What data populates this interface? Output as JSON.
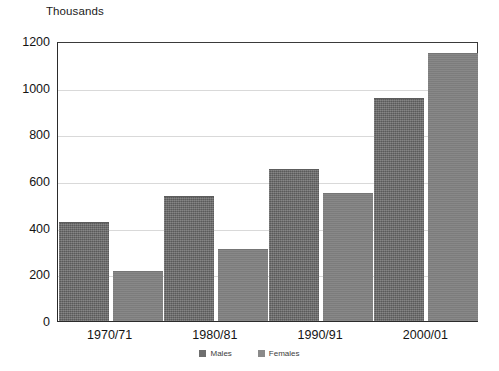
{
  "chart_data": {
    "type": "bar",
    "title": "",
    "subtitle": "",
    "unit_caption": "Thousands",
    "xlabel": "",
    "ylabel": "",
    "categories": [
      "1970/71",
      "1980/81",
      "1990/91",
      "2000/01"
    ],
    "series": [
      {
        "name": "Males",
        "color": "#6e6e6e",
        "values": [
          425,
          535,
          650,
          955
        ]
      },
      {
        "name": "Females",
        "color": "#828282",
        "values": [
          215,
          310,
          550,
          1150
        ]
      }
    ],
    "ylim": [
      0,
      1200
    ],
    "ytick_values": [
      0,
      200,
      400,
      600,
      800,
      1000,
      1200
    ],
    "ytick_labels": [
      "0",
      "200",
      "400",
      "600",
      "800",
      "1000",
      "1200"
    ],
    "grid": "horizontal",
    "legend_position": "bottom-center",
    "annotations": []
  }
}
